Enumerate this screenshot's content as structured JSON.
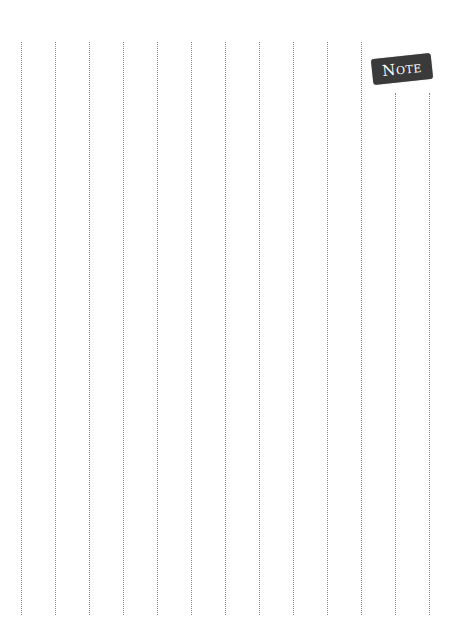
{
  "page": {
    "type": "notebook-page",
    "background_color": "#ffffff"
  },
  "badge": {
    "label": "Note",
    "background_color": "#3a3a3a",
    "text_color": "#ffffff"
  },
  "rule_lines": {
    "orientation": "vertical",
    "style": "dotted",
    "color": "#8a8a8a",
    "count": 13,
    "positions_x": [
      21,
      55,
      89,
      123,
      157,
      191,
      225,
      259,
      293,
      327,
      361,
      395,
      429
    ],
    "top_full": 42,
    "top_short": 93,
    "bottom": 615
  }
}
